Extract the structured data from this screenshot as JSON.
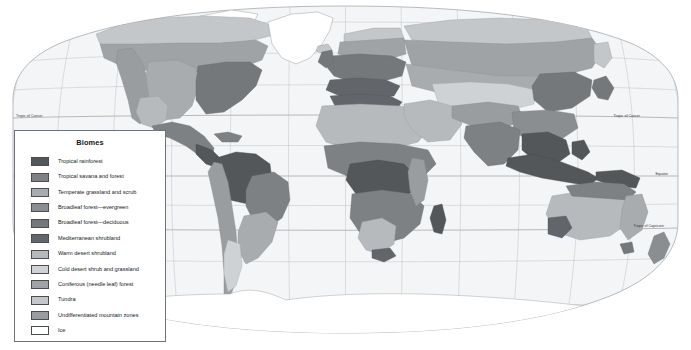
{
  "map": {
    "projection": "robinson",
    "ocean_color": "#f4f5f6",
    "graticule_color": "#b9bcc0",
    "border_color": "#9aa0a6",
    "latitude_lines": [
      {
        "name": "tropic-of-cancer",
        "label": "Tropic of Cancer",
        "y": 118
      },
      {
        "name": "equator",
        "label": "Equator",
        "y": 176
      },
      {
        "name": "tropic-of-capricorn",
        "label": "Tropic of Capricorn",
        "y": 228
      }
    ]
  },
  "legend": {
    "title": "Biomes",
    "items": [
      {
        "label": "Tropical rainforest",
        "color": "#545759"
      },
      {
        "label": "Tropical savana and forest",
        "color": "#7e8184"
      },
      {
        "label": "Temperate grassland and scrub",
        "color": "#a9acae"
      },
      {
        "label": "Broadleaf forest—evergreen",
        "color": "#8b8e91"
      },
      {
        "label": "Broadleaf forest—deciduous",
        "color": "#75787b"
      },
      {
        "label": "Mediterranean shrubland",
        "color": "#626569"
      },
      {
        "label": "Warm desert shrubland",
        "color": "#b7babd"
      },
      {
        "label": "Cold desert shrub and grassland",
        "color": "#cfd2d4"
      },
      {
        "label": "Coniferous (needle leaf) forest",
        "color": "#a0a3a6"
      },
      {
        "label": "Tundra",
        "color": "#c4c7c9"
      },
      {
        "label": "Undifferentiated mountain zones",
        "color": "#9a9da0"
      },
      {
        "label": "Ice",
        "color": "#ffffff"
      }
    ]
  }
}
